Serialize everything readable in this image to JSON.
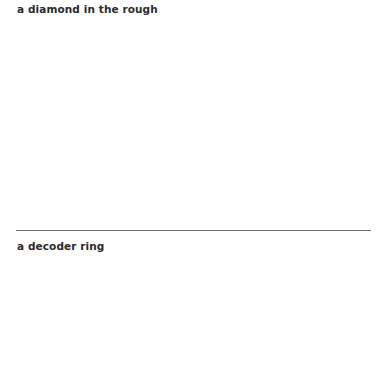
{
  "panels": [
    {
      "caption": "a diamond in the rough"
    },
    {
      "caption": "a decoder ring"
    }
  ]
}
